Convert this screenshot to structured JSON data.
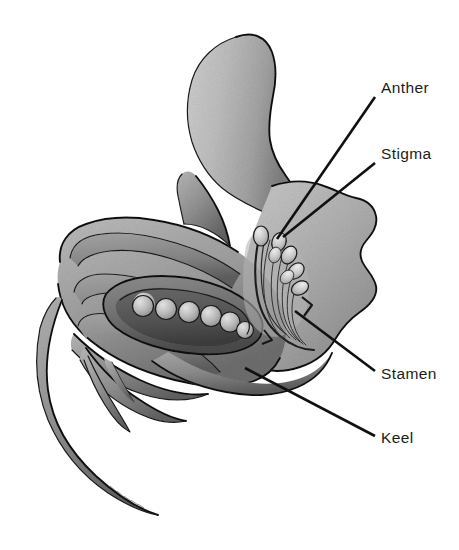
{
  "figure": {
    "background_color": "#ffffff",
    "width": 459,
    "height": 550,
    "line_color": "#101010",
    "ink_color": "#1c1c1c"
  },
  "labels": [
    {
      "id": "anther",
      "text": "Anther",
      "text_x": 381,
      "text_y": 93,
      "leader": {
        "x1": 375,
        "y1": 97,
        "x2": 277,
        "y2": 239
      }
    },
    {
      "id": "stigma",
      "text": "Stigma",
      "text_x": 381,
      "text_y": 159,
      "leader": {
        "x1": 375,
        "y1": 163,
        "x2": 283,
        "y2": 237
      }
    },
    {
      "id": "stamen",
      "text": "Stamen",
      "text_x": 381,
      "text_y": 379,
      "leader": {
        "x1": 375,
        "y1": 371,
        "x2": 295,
        "y2": 311
      }
    },
    {
      "id": "keel",
      "text": "Keel",
      "text_x": 381,
      "text_y": 443,
      "leader": {
        "x1": 375,
        "y1": 436,
        "x2": 245,
        "y2": 368
      }
    }
  ],
  "structures": [
    {
      "id": "standard-petal",
      "name": "standard petal"
    },
    {
      "id": "wing-petal-right",
      "name": "right wing petal"
    },
    {
      "id": "wing-petal-left",
      "name": "left wing lobe"
    },
    {
      "id": "keel-petal",
      "name": "keel petal"
    },
    {
      "id": "calyx-tube",
      "name": "calyx tube"
    },
    {
      "id": "sepal-lobes",
      "name": "sepal lobes"
    },
    {
      "id": "pedicel",
      "name": "pedicel"
    },
    {
      "id": "ovary",
      "name": "ovary"
    },
    {
      "id": "ovules",
      "name": "ovules",
      "count": 6
    },
    {
      "id": "style",
      "name": "style"
    },
    {
      "id": "anthers",
      "name": "anthers",
      "count": 6
    },
    {
      "id": "filaments",
      "name": "filaments"
    }
  ],
  "palette": {
    "mid_gray": "#9a9a9a",
    "light_gray": "#c8c8c8",
    "dark_gray": "#5a5a5a",
    "deep_gray": "#404040",
    "ink": "#101010"
  }
}
